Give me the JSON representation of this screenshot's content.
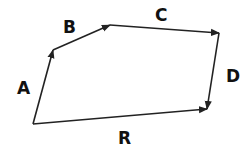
{
  "diagram": {
    "colors": {
      "stroke": "#222222",
      "text": "#111111",
      "background": "#ffffff"
    },
    "vectors": [
      {
        "label": "A",
        "from": [
          33,
          124
        ],
        "to": [
          53,
          50
        ],
        "label_pos": [
          17,
          94
        ]
      },
      {
        "label": "B",
        "from": [
          53,
          50
        ],
        "to": [
          110,
          25
        ],
        "label_pos": [
          63,
          33
        ]
      },
      {
        "label": "C",
        "from": [
          110,
          25
        ],
        "to": [
          219,
          33
        ],
        "label_pos": [
          155,
          21
        ]
      },
      {
        "label": "D",
        "from": [
          219,
          33
        ],
        "to": [
          207,
          109
        ],
        "label_pos": [
          226,
          82
        ]
      },
      {
        "label": "R",
        "from": [
          33,
          124
        ],
        "to": [
          207,
          109
        ],
        "label_pos": [
          118,
          144
        ]
      }
    ]
  }
}
